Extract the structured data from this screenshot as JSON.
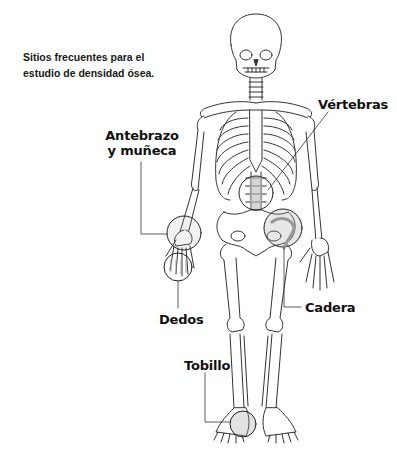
{
  "title": "Sitios frecuentes para el estudio de densidad ósea.",
  "caption_lines": [
    "Sitios frecuentes para el",
    "estudio de densidad ósea."
  ],
  "labels": {
    "vertebras": "Vértebras",
    "antebrazo_line1": "Antebrazo",
    "antebrazo_line2": "y muñeca",
    "dedos": "Dedos",
    "cadera": "Cadera",
    "tobillo": "Tobillo"
  },
  "colors": {
    "background": "#ffffff",
    "text": "#111111",
    "line": "#333333",
    "highlight": "#9a9a9a"
  }
}
